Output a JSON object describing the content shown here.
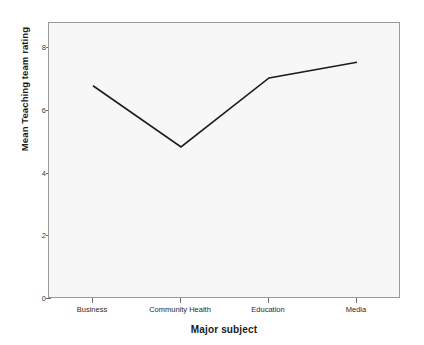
{
  "chart_data": {
    "type": "line",
    "title": "",
    "subtitle": "",
    "xlabel": "Major subject",
    "ylabel": "Mean Teaching team rating",
    "categories": [
      "Business",
      "Community Health",
      "Education",
      "Media"
    ],
    "values": [
      6.8,
      4.85,
      7.05,
      7.55
    ],
    "series": [
      {
        "name": "Mean Teaching team rating",
        "values": [
          6.8,
          4.85,
          7.05,
          7.55
        ]
      }
    ],
    "ylim": [
      0,
      8.8
    ],
    "y_ticks": [
      0,
      2,
      4,
      6,
      8
    ],
    "y_tick_labels": [
      "0",
      "2",
      "4",
      "6",
      "8"
    ],
    "xlim_categories": 4,
    "grid": false,
    "legend": false,
    "legend_position": "none",
    "line_color": "#1c1c1c",
    "plot_background": "#f7f7f7",
    "frame_color": "#9a9a9a",
    "figure_background": "#ffffff",
    "markers": false
  }
}
